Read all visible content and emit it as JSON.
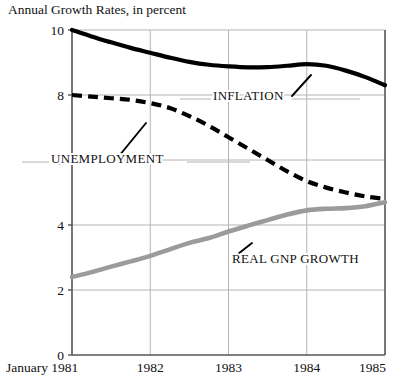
{
  "chart_data": {
    "type": "line",
    "title": "Annual Growth Rates, in percent",
    "xlabel": "",
    "ylabel": "",
    "ylim": [
      0,
      10
    ],
    "yticks": [
      "0",
      "2",
      "4",
      "6",
      "8",
      "10"
    ],
    "ytick_values": [
      0,
      2,
      4,
      6,
      8,
      10
    ],
    "xticks": [
      "January 1981",
      "1982",
      "1983",
      "1984",
      "1985"
    ],
    "xtick_values": [
      1981,
      1982,
      1983,
      1984,
      1985
    ],
    "xlim": [
      1981,
      1985
    ],
    "grid": true,
    "legend_position": "inline-annotations",
    "series": [
      {
        "name": "INFLATION",
        "style": "solid",
        "color": "#000000",
        "width": 4.2,
        "x": [
          1981,
          1981.25,
          1981.5,
          1981.75,
          1982,
          1982.25,
          1982.5,
          1982.75,
          1983,
          1983.25,
          1983.5,
          1983.75,
          1984,
          1984.25,
          1984.5,
          1984.75,
          1985
        ],
        "values": [
          10.0,
          9.8,
          9.62,
          9.45,
          9.3,
          9.15,
          9.02,
          8.93,
          8.88,
          8.85,
          8.86,
          8.9,
          8.95,
          8.9,
          8.75,
          8.55,
          8.3
        ]
      },
      {
        "name": "UNEMPLOYMENT",
        "style": "dashed",
        "color": "#000000",
        "width": 4.2,
        "x": [
          1981,
          1981.25,
          1981.5,
          1981.75,
          1982,
          1982.25,
          1982.5,
          1982.75,
          1983,
          1983.25,
          1983.5,
          1983.75,
          1984,
          1984.25,
          1984.5,
          1984.75,
          1985
        ],
        "values": [
          8.0,
          7.95,
          7.9,
          7.85,
          7.75,
          7.6,
          7.35,
          7.05,
          6.7,
          6.35,
          6.0,
          5.65,
          5.35,
          5.15,
          5.0,
          4.88,
          4.8
        ]
      },
      {
        "name": "REAL GNP GROWTH",
        "style": "solid",
        "color": "#9b9b9b",
        "width": 4.6,
        "x": [
          1981,
          1981.25,
          1981.5,
          1981.75,
          1982,
          1982.25,
          1982.5,
          1982.75,
          1983,
          1983.25,
          1983.5,
          1983.75,
          1984,
          1984.25,
          1984.5,
          1984.75,
          1985
        ],
        "values": [
          2.4,
          2.55,
          2.72,
          2.88,
          3.05,
          3.25,
          3.45,
          3.6,
          3.8,
          3.98,
          4.15,
          4.32,
          4.45,
          4.5,
          4.52,
          4.58,
          4.7
        ]
      }
    ],
    "annotations": [
      {
        "text": "INFLATION",
        "x_px": 213,
        "y_px": 100,
        "leader": "up-right"
      },
      {
        "text": "UNEMPLOYMENT",
        "x_px": 51,
        "y_px": 163,
        "leader": "up-right"
      },
      {
        "text": "REAL GNP GROWTH",
        "x_px": 232,
        "y_px": 263,
        "leader": "up-left"
      }
    ]
  },
  "colors": {
    "background": "#ffffff",
    "axis": "#555555",
    "grid": "#b4b4b4",
    "ink": "#111111",
    "gnp_gray": "#9b9b9b"
  }
}
